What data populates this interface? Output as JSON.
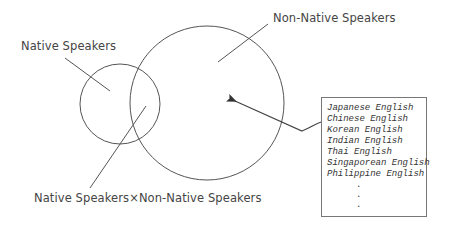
{
  "diagram": {
    "labels": {
      "native": "Native Speakers",
      "non_native": "Non-Native Speakers",
      "intersection": "Native Speakers×Non-Native Speakers"
    },
    "list_box": {
      "items": [
        "Japanese English",
        "Chinese English",
        "Korean English",
        "Indian English",
        "Thai English",
        "Singaporean English",
        "Philippine English"
      ],
      "continuation": [
        ".",
        ".",
        "."
      ]
    },
    "colors": {
      "stroke": "#444444",
      "text": "#444444",
      "background": "#ffffff"
    }
  }
}
